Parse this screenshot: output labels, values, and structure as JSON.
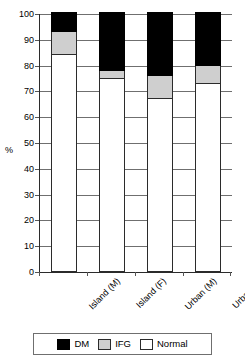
{
  "chart_data": {
    "type": "bar",
    "subtype": "stacked-100-percent",
    "title": "",
    "xlabel": "",
    "ylabel": "%",
    "ylim": [
      0,
      100
    ],
    "yticks": [
      0,
      10,
      20,
      30,
      40,
      50,
      60,
      70,
      80,
      90,
      100
    ],
    "ytick_labels": [
      "0",
      "10",
      "20",
      "30",
      "40",
      "50",
      "60",
      "70",
      "80",
      "90",
      "100"
    ],
    "grid": "horizontal",
    "legend_position": "bottom",
    "categories": [
      "Island (M)",
      "Island (F)",
      "Urban (M)",
      "Urban (F)"
    ],
    "series": [
      {
        "name": "Normal",
        "color": "#ffffff",
        "values": [
          84,
          75,
          67,
          73
        ]
      },
      {
        "name": "IFG",
        "color": "#cfcfcf",
        "values": [
          9,
          3,
          9,
          7
        ]
      },
      {
        "name": "DM",
        "color": "#000000",
        "values": [
          7,
          22,
          24,
          20
        ]
      }
    ],
    "stack_order_bottom_to_top": [
      "Normal",
      "IFG",
      "DM"
    ],
    "legend_entries": [
      {
        "label": "DM",
        "color": "#000000"
      },
      {
        "label": "IFG",
        "color": "#cfcfcf"
      },
      {
        "label": "Normal",
        "color": "#ffffff"
      }
    ]
  },
  "axis": {
    "y_title": "%"
  },
  "colors": {
    "dm": "#000000",
    "ifg": "#cfcfcf",
    "normal": "#ffffff",
    "axis": "#2b2b2b",
    "grid": "#6f6f6f"
  }
}
